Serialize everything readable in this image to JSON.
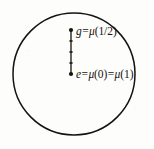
{
  "figure": {
    "kind": "topological-group-loop-diagram",
    "background_color": "#fdfdfc",
    "ink_color": "#15130f",
    "circle": {
      "center_x": 74,
      "center_y": 74,
      "radius": 61,
      "stroke_width": 1.5,
      "filled": false
    },
    "segment": {
      "x": 71,
      "y_top": 30,
      "y_bottom": 74,
      "stroke_width": 1.3,
      "endpoint_dot_radius": 2.1,
      "tick_positions_y": [
        41,
        52,
        63
      ],
      "tick_half_width": 1.6
    },
    "labels": {
      "top": {
        "id": "label-g",
        "text": "g=μ(1/2)",
        "lhs": "g",
        "equals": "=",
        "mu": "μ",
        "open_paren": "(",
        "argument": "1/2",
        "close_paren": ")"
      },
      "bottom": {
        "id": "label-e",
        "text": "e=μ(0)=μ(1)",
        "lhs": "e",
        "equals_first": "=",
        "mu_first": "μ",
        "open_paren_first": "(",
        "argument_first": "0",
        "close_paren_first": ")",
        "equals_second": "=",
        "mu_second": "μ",
        "open_paren_second": "(",
        "argument_second": "1",
        "close_paren_second": ")"
      }
    }
  }
}
